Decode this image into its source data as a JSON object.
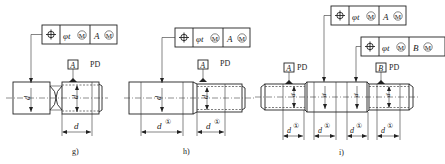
{
  "figures": [
    {
      "id": "g",
      "caption": "g)",
      "frame": {
        "symbol": "position-symbol",
        "cells": [
          "φtⓂ",
          "AⓂ"
        ],
        "tolerance": "φt",
        "tolerance_modifier": "M",
        "datum": "A",
        "datum_modifier": "M"
      },
      "datum_label": "A",
      "pd_label": "PD",
      "dims": {
        "shank": "ds",
        "thread": "d",
        "length": "d"
      }
    },
    {
      "id": "h",
      "caption": "h)",
      "frame": {
        "symbol": "position-symbol",
        "cells": [
          "φtⓂ",
          "AⓂ"
        ],
        "tolerance": "φt",
        "tolerance_modifier": "M",
        "datum": "A",
        "datum_modifier": "M"
      },
      "datum_label": "A",
      "pd_label": "PD",
      "dims": {
        "shank": "ds",
        "thread": "d",
        "length_left": "d①",
        "length_right": "d①"
      }
    },
    {
      "id": "i",
      "caption": "i)",
      "frames": [
        {
          "symbol": "position-symbol",
          "tolerance": "φt",
          "tolerance_modifier": "M",
          "datum": "A",
          "datum_modifier": "M"
        },
        {
          "symbol": "position-symbol",
          "tolerance": "φt",
          "tolerance_modifier": "M",
          "datum": "B",
          "datum_modifier": "M"
        }
      ],
      "datum_labels": [
        "A",
        "B"
      ],
      "pd_label": "PD",
      "dims": {
        "section_labels": [
          "d",
          "ds",
          "ds",
          "d"
        ],
        "lengths": [
          "d①",
          "d①",
          "d①",
          "d①"
        ]
      }
    }
  ],
  "labels": {
    "phi_t": "φt",
    "M": "M",
    "A": "A",
    "B": "B",
    "PD": "PD",
    "d": "d",
    "ds": "d",
    "s_sub": "s",
    "circ1": "①"
  }
}
